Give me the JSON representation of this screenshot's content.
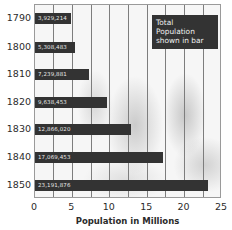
{
  "chart_data": {
    "type": "bar",
    "orientation": "horizontal",
    "title": "",
    "xlabel": "Population in Millions",
    "ylabel": "",
    "xlim": [
      0,
      25
    ],
    "xticks": [
      "0",
      "5",
      "10",
      "15",
      "20",
      "25"
    ],
    "grid": true,
    "categories": [
      "1790",
      "1800",
      "1810",
      "1820",
      "1830",
      "1840",
      "1850"
    ],
    "values": [
      3929214,
      5308483,
      7239881,
      9638453,
      12866020,
      17069453,
      23191876
    ],
    "value_labels": [
      "3,929,214",
      "5,308,483",
      "7,239,881",
      "9,638,453",
      "12,866,020",
      "17,069,453",
      "23,191,876"
    ],
    "legend": "Total Population shown in bar",
    "legend_lines": [
      "Total",
      "Population",
      "shown in bar"
    ],
    "bar_color": "#333333"
  }
}
